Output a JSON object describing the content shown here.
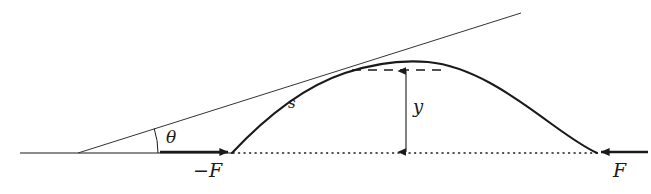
{
  "figure": {
    "background_color": "#ffffff",
    "stroke_color": "#1a1a1a",
    "width": 651,
    "height": 194
  },
  "labels": {
    "theta": "θ",
    "arc_length": "s",
    "height": "y",
    "force_left": "−F",
    "force_right": "F"
  },
  "elements": {
    "baseline": {
      "name": "horizontal-baseline",
      "style": "solid",
      "x1": 20,
      "y1": 153,
      "x2": 232,
      "y2": 153
    },
    "dotted_baseline": {
      "name": "dotted-baseline",
      "style": "dotted",
      "x1": 232,
      "y1": 153,
      "x2": 597,
      "y2": 153
    },
    "tangent_line": {
      "name": "tangent-line",
      "style": "solid",
      "x1": 78,
      "y1": 153,
      "x2": 521,
      "y2": 13
    },
    "angle_arc": {
      "name": "theta-angle-arc",
      "vertex_x": 78,
      "vertex_y": 153,
      "radius": 80
    },
    "curve": {
      "name": "trajectory-curve",
      "start_x": 232,
      "start_y": 153,
      "apex_x": 428,
      "apex_y": 62,
      "end_x": 597,
      "end_y": 153
    },
    "dashed_level_line": {
      "name": "apex-level-dashed-line",
      "x1": 352,
      "y1": 70,
      "x2": 441,
      "y2": 70
    },
    "height_arrow": {
      "name": "height-measure-arrow",
      "x": 406,
      "y_top": 70,
      "y_bottom": 153,
      "double_headed": true
    },
    "force_left_arrow": {
      "name": "force-left-arrow",
      "x1": 160,
      "y1": 152,
      "x2": 229,
      "y2": 152,
      "direction": "right"
    },
    "force_right_arrow": {
      "name": "force-right-arrow",
      "x1": 648,
      "y1": 152,
      "x2": 600,
      "y2": 152,
      "direction": "left"
    }
  },
  "label_positions": {
    "theta": {
      "x": 166,
      "y": 129
    },
    "arc_length": {
      "x": 288,
      "y": 96
    },
    "height": {
      "x": 413,
      "y": 98
    },
    "force_left": {
      "x": 193,
      "y": 161
    },
    "force_right": {
      "x": 613,
      "y": 161
    }
  }
}
